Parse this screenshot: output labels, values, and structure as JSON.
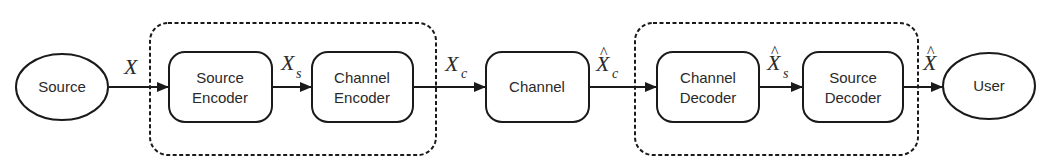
{
  "diagram": {
    "type": "communication-system-block-diagram",
    "colors": {
      "stroke": "#1a1a1a",
      "text": "#2a2a2a",
      "background": "#ffffff"
    },
    "nodes": [
      {
        "id": "source",
        "shape": "ellipse",
        "lines": [
          "Source"
        ]
      },
      {
        "id": "source_encoder",
        "shape": "rounded-rect",
        "lines": [
          "Source",
          "Encoder"
        ]
      },
      {
        "id": "channel_encoder",
        "shape": "rounded-rect",
        "lines": [
          "Channel",
          "Encoder"
        ]
      },
      {
        "id": "channel",
        "shape": "rounded-rect",
        "lines": [
          "Channel"
        ]
      },
      {
        "id": "channel_decoder",
        "shape": "rounded-rect",
        "lines": [
          "Channel",
          "Decoder"
        ]
      },
      {
        "id": "source_decoder",
        "shape": "rounded-rect",
        "lines": [
          "Source",
          "Decoder"
        ]
      },
      {
        "id": "user",
        "shape": "ellipse",
        "lines": [
          "User"
        ]
      }
    ],
    "groups": [
      {
        "id": "encoder_group",
        "style": "dashed",
        "contains": [
          "source_encoder",
          "channel_encoder"
        ]
      },
      {
        "id": "decoder_group",
        "style": "dashed",
        "contains": [
          "channel_decoder",
          "source_decoder"
        ]
      }
    ],
    "edges": [
      {
        "from": "source",
        "to": "source_encoder",
        "label": {
          "base": "X",
          "sub": "",
          "hat": false
        }
      },
      {
        "from": "source_encoder",
        "to": "channel_encoder",
        "label": {
          "base": "X",
          "sub": "s",
          "hat": false
        }
      },
      {
        "from": "channel_encoder",
        "to": "channel",
        "label": {
          "base": "X",
          "sub": "c",
          "hat": false
        }
      },
      {
        "from": "channel",
        "to": "channel_decoder",
        "label": {
          "base": "X",
          "sub": "c",
          "hat": true,
          "hat_glyph": "^"
        }
      },
      {
        "from": "channel_decoder",
        "to": "source_decoder",
        "label": {
          "base": "X",
          "sub": "s",
          "hat": true,
          "hat_glyph": "^"
        }
      },
      {
        "from": "source_decoder",
        "to": "user",
        "label": {
          "base": "X",
          "sub": "",
          "hat": true,
          "hat_glyph": "^"
        }
      }
    ]
  }
}
